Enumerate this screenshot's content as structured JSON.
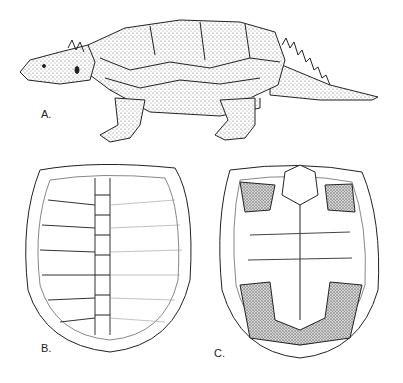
{
  "figure": {
    "panels": [
      {
        "id": "A",
        "label": "A.",
        "subject": "turtle-lateral-reconstruction"
      },
      {
        "id": "B",
        "label": "B.",
        "subject": "carapace-dorsal-view"
      },
      {
        "id": "C",
        "label": "C.",
        "subject": "plastron-ventral-view"
      }
    ],
    "colors": {
      "ink": "#222222",
      "stipple": "#555555",
      "background": "#ffffff",
      "fill": "#cfcfcf"
    }
  }
}
